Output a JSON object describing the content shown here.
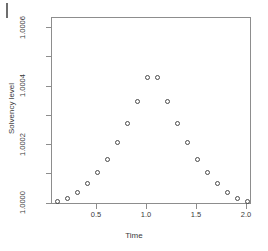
{
  "figure": {
    "artifact_name": "page-edge-scan-mark"
  },
  "chart_data": {
    "type": "scatter",
    "title": "",
    "xlabel": "Time",
    "ylabel": "Solvency level",
    "grid": false,
    "legend": null,
    "xlim": [
      0.05,
      2.05
    ],
    "ylim": [
      0.999995,
      1.000635
    ],
    "xticks": [
      0.5,
      1.0,
      1.5,
      2.0
    ],
    "xtick_labels": [
      "0.5",
      "1.0",
      "1.5",
      "2.0"
    ],
    "yticks": [
      1.0,
      1.0002,
      1.0004,
      1.0006
    ],
    "ytick_labels": [
      "1.0000",
      "1.0002",
      "1.0004",
      "1.0006"
    ],
    "yminor_ticks": [
      1.0001,
      1.0003,
      1.0005
    ],
    "point_marker": "open-circle",
    "point_color": "#4a4a4a",
    "frame_color": "#8d8d8d",
    "background_color": "#ffffff",
    "x": [
      0.1,
      0.2,
      0.3,
      0.4,
      0.5,
      0.6,
      0.7,
      0.8,
      0.9,
      1.0,
      1.1,
      1.2,
      1.3,
      1.4,
      1.5,
      1.6,
      1.7,
      1.8,
      1.9,
      2.0
    ],
    "y": [
      1.000007,
      1.000018,
      1.000038,
      1.000067,
      1.000105,
      1.000152,
      1.000208,
      1.000273,
      1.000348,
      1.000432,
      1.000432,
      1.000348,
      1.000273,
      1.000208,
      1.000152,
      1.000105,
      1.000067,
      1.000038,
      1.000018,
      1.000007
    ],
    "points": [
      {
        "x": 0.1,
        "y": 1.000007
      },
      {
        "x": 0.2,
        "y": 1.000018
      },
      {
        "x": 0.3,
        "y": 1.000038
      },
      {
        "x": 0.4,
        "y": 1.000067
      },
      {
        "x": 0.5,
        "y": 1.000105
      },
      {
        "x": 0.6,
        "y": 1.000152
      },
      {
        "x": 0.7,
        "y": 1.000208
      },
      {
        "x": 0.8,
        "y": 1.000273
      },
      {
        "x": 0.9,
        "y": 1.000348
      },
      {
        "x": 1.0,
        "y": 1.000432
      },
      {
        "x": 1.1,
        "y": 1.000432
      },
      {
        "x": 1.2,
        "y": 1.000348
      },
      {
        "x": 1.3,
        "y": 1.000273
      },
      {
        "x": 1.4,
        "y": 1.000208
      },
      {
        "x": 1.5,
        "y": 1.000152
      },
      {
        "x": 1.6,
        "y": 1.000105
      },
      {
        "x": 1.7,
        "y": 1.000067
      },
      {
        "x": 1.8,
        "y": 1.000038
      },
      {
        "x": 1.9,
        "y": 1.000018
      },
      {
        "x": 2.0,
        "y": 1.000007
      }
    ]
  }
}
